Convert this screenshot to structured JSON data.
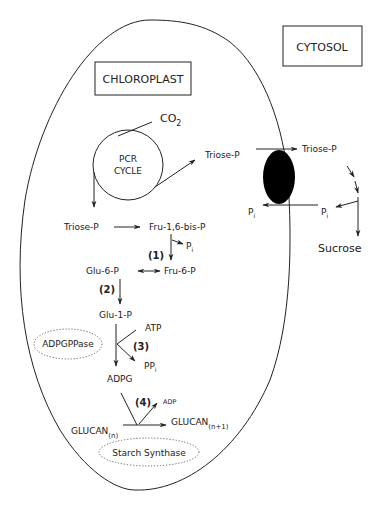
{
  "compartments": {
    "chloroplast_label": "CHLOROPLAST",
    "cytosol_label": "CYTOSOL"
  },
  "cycle": {
    "line1": "PCR",
    "line2": "CYCLE",
    "input": "CO",
    "input_sub": "2"
  },
  "metabolites": {
    "triose_p_export": "Triose-P",
    "triose_p_internal": "Triose-P",
    "fru_bisp": "Fru-1,6-bis-P",
    "pi_1": "P",
    "pi_1_sub": "i",
    "glu6p": "Glu-6-P",
    "fru6p": "Fru-6-P",
    "glu1p": "Glu-1-P",
    "atp": "ATP",
    "ppi": "PP",
    "ppi_sub": "i",
    "adpg": "ADPG",
    "adp": "ADP",
    "glucan_n": "GLUCAN",
    "glucan_n_sub": "(n)",
    "glucan_n1": "GLUCAN",
    "glucan_n1_sub": "(n+1)"
  },
  "transport": {
    "pi_chloroplast": "P",
    "pi_chloroplast_sub": "i",
    "triose_p_cytosol": "Triose-P",
    "pi_cytosol": "P",
    "pi_cytosol_sub": "i",
    "sucrose": "Sucrose"
  },
  "steps": {
    "s1": "(1)",
    "s2": "(2)",
    "s3": "(3)",
    "s4": "(4)"
  },
  "enzymes": {
    "adpgppase": "ADPGPPase",
    "starch_synthase": "Starch Synthase"
  },
  "colors": {
    "ink": "#222222",
    "background": "#ffffff",
    "translocator": "#000000"
  }
}
